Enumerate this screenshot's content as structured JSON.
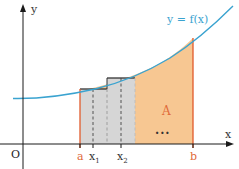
{
  "diagram": {
    "curve_label": "y = f(x)",
    "area_label": "A",
    "ellipsis": "...",
    "axes": {
      "x_label": "x",
      "y_label": "y",
      "origin_label": "O"
    },
    "ticks": {
      "a": "a",
      "x1_main": "x",
      "x1_sub": "1",
      "x2_main": "x",
      "x2_sub": "2",
      "b": "b"
    },
    "colors": {
      "curve": "#3aa3d0",
      "area_fill": "#f7c48c",
      "rect_fill": "#d9d9d9",
      "bound_lines": "#e05a2b",
      "label_orange": "#e06a3a",
      "axis": "#1a1a1a",
      "rect_top": "#333333"
    }
  }
}
